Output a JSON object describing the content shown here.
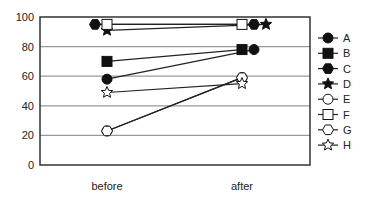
{
  "chart_data": {
    "type": "line",
    "title": "",
    "xlabel": "",
    "ylabel": "",
    "categories": [
      "before",
      "after"
    ],
    "ylim": [
      0,
      100
    ],
    "yticks": [
      0,
      20,
      40,
      60,
      80,
      100
    ],
    "grid": true,
    "legend_position": "right",
    "series": [
      {
        "name": "A",
        "marker": "filled-circle",
        "values": [
          58,
          78
        ]
      },
      {
        "name": "B",
        "marker": "filled-square",
        "values": [
          70,
          78
        ]
      },
      {
        "name": "C",
        "marker": "filled-hexagon",
        "values": [
          95,
          95
        ]
      },
      {
        "name": "D",
        "marker": "filled-star",
        "values": [
          91,
          95
        ]
      },
      {
        "name": "E",
        "marker": "open-circle",
        "values": [
          23,
          59
        ]
      },
      {
        "name": "F",
        "marker": "open-square",
        "values": [
          95,
          95
        ]
      },
      {
        "name": "G",
        "marker": "open-hexagon",
        "values": [
          23,
          59
        ]
      },
      {
        "name": "H",
        "marker": "open-star",
        "values": [
          49,
          55
        ]
      }
    ]
  },
  "axis": {
    "y_tick_labels": [
      "0",
      "20",
      "40",
      "60",
      "80",
      "100"
    ],
    "x_tick_labels": [
      "before",
      "after"
    ]
  },
  "legend": {
    "items": [
      "A",
      "B",
      "C",
      "D",
      "E",
      "F",
      "G",
      "H"
    ]
  }
}
